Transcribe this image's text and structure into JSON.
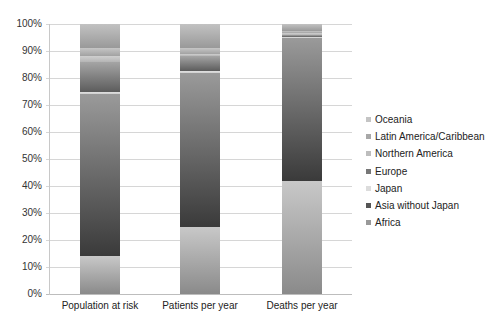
{
  "chart_data": {
    "type": "bar",
    "stacked": true,
    "percent_stacked": true,
    "title": "",
    "xlabel": "",
    "ylabel": "",
    "ylim": [
      0,
      100
    ],
    "yticks": [
      "0%",
      "10%",
      "20%",
      "30%",
      "40%",
      "50%",
      "60%",
      "70%",
      "80%",
      "90%",
      "100%"
    ],
    "grid": true,
    "legend_position": "right",
    "categories": [
      "Population at risk",
      "Patients per year",
      "Deaths per year"
    ],
    "series": [
      {
        "name": "Africa",
        "color": "#9a9a9a",
        "values": [
          14,
          25,
          42
        ]
      },
      {
        "name": "Asia without Japan",
        "color": "#4a4a4a",
        "values": [
          60,
          57,
          53
        ]
      },
      {
        "name": "Japan",
        "color": "#d4d4d4",
        "values": [
          1,
          0.5,
          0.2
        ]
      },
      {
        "name": "Europe",
        "color": "#777777",
        "values": [
          11,
          5.5,
          0.8
        ]
      },
      {
        "name": "Northern America",
        "color": "#bdbdbd",
        "values": [
          2,
          1,
          0.5
        ]
      },
      {
        "name": "Latin America/Caribbean",
        "color": "#a8a8a8",
        "values": [
          3,
          2,
          1
        ]
      },
      {
        "name": "Oceania",
        "color": "#b4b4b4",
        "values": [
          9,
          9,
          2.5
        ]
      }
    ]
  },
  "legend": {
    "items": [
      {
        "label": "Oceania",
        "color": "#c4c4c4"
      },
      {
        "label": "Latin America/Caribbean",
        "color": "#a8a8a8"
      },
      {
        "label": "Northern America",
        "color": "#bdbdbd"
      },
      {
        "label": "Europe",
        "color": "#777777"
      },
      {
        "label": "Japan",
        "color": "#dcdcdc"
      },
      {
        "label": "Asia without Japan",
        "color": "#555555"
      },
      {
        "label": "Africa",
        "color": "#999999"
      }
    ]
  }
}
